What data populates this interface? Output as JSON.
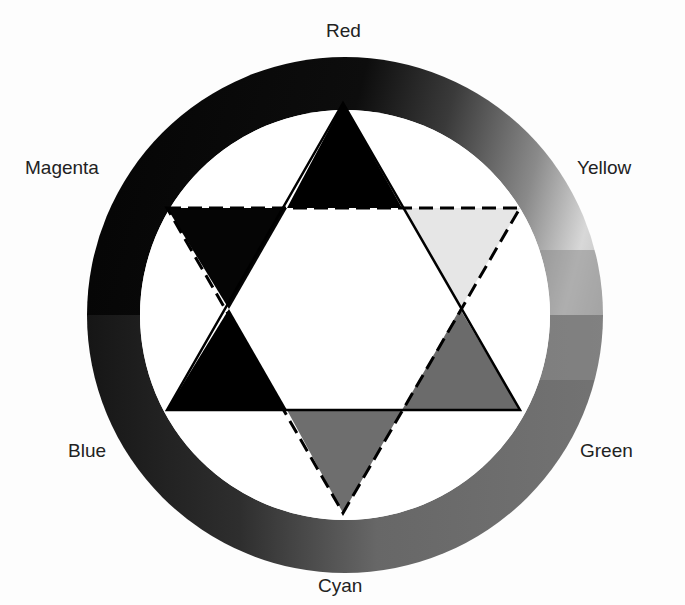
{
  "diagram": {
    "type": "color-wheel",
    "labels": {
      "top": "Red",
      "upper_right": "Yellow",
      "lower_right": "Green",
      "bottom": "Cyan",
      "lower_left": "Blue",
      "upper_left": "Magenta"
    },
    "ring": {
      "center": [
        345,
        315
      ],
      "outer_radius": 258,
      "inner_radius": 205,
      "gradient_stops": [
        {
          "angle_label": "Red",
          "shade": "#1a1a1a"
        },
        {
          "angle_label": "Yellow",
          "shade": "#dcdcdc"
        },
        {
          "angle_label": "Green",
          "shade": "#7a7a7a"
        },
        {
          "angle_label": "Cyan",
          "shade": "#6a6a6a"
        },
        {
          "angle_label": "Blue",
          "shade": "#0a0a0a"
        },
        {
          "angle_label": "Magenta",
          "shade": "#0a0a0a"
        }
      ]
    },
    "star": {
      "solid_triangle": {
        "points": [
          [
            343,
            103
          ],
          [
            167,
            410
          ],
          [
            520,
            410
          ]
        ],
        "line_style": "solid"
      },
      "dashed_triangle": {
        "points": [
          [
            167,
            208
          ],
          [
            520,
            208
          ],
          [
            343,
            513
          ]
        ],
        "line_style": "dashed"
      },
      "points": [
        {
          "name": "Red",
          "fill": "#000000"
        },
        {
          "name": "Yellow",
          "fill": "#e6e6e6"
        },
        {
          "name": "Green",
          "fill": "#6b6b6b"
        },
        {
          "name": "Cyan",
          "fill": "#6e6e6e"
        },
        {
          "name": "Blue",
          "fill": "#000000"
        },
        {
          "name": "Magenta",
          "fill": "#050505"
        }
      ],
      "center_fill": "#ffffff"
    }
  }
}
